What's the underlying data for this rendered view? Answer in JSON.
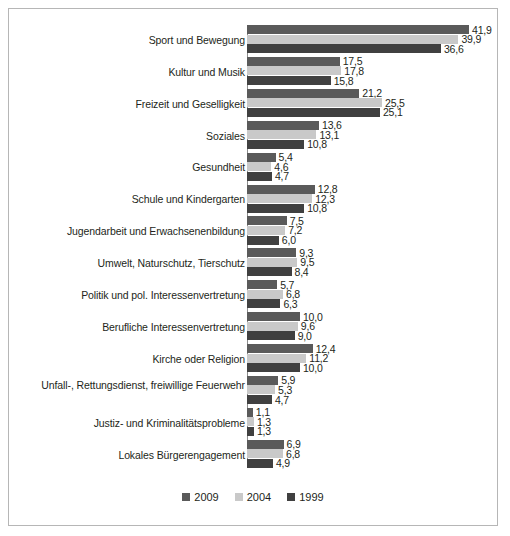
{
  "chart_data": {
    "type": "bar",
    "orientation": "horizontal",
    "title": "",
    "subtitle": "",
    "xlabel": "",
    "ylabel": "",
    "grid": false,
    "xlim": [
      0,
      41.9
    ],
    "value_format": "comma-decimal",
    "legend_position": "bottom-center",
    "categories": [
      "Sport und Bewegung",
      "Kultur und Musik",
      "Freizeit und Geselligkeit",
      "Soziales",
      "Gesundheit",
      "Schule und Kindergarten",
      "Jugendarbeit und Erwachsenenbildung",
      "Umwelt, Naturschutz, Tierschutz",
      "Politik und pol. Interessenvertretung",
      "Berufliche Interessenvertretung",
      "Kirche oder Religion",
      "Unfall-, Rettungsdienst, freiwillige Feuerwehr",
      "Justiz- und Kriminalitätsprobleme",
      "Lokales Bürgerengagement"
    ],
    "series": [
      {
        "name": "2009",
        "color": "#5a5a5a",
        "values": [
          41.9,
          17.5,
          21.2,
          13.6,
          5.4,
          12.8,
          7.5,
          9.3,
          5.7,
          10.0,
          12.4,
          5.9,
          1.1,
          6.9
        ],
        "labels": [
          "41,9",
          "17,5",
          "21,2",
          "13,6",
          "5,4",
          "12,8",
          "7,5",
          "9,3",
          "5,7",
          "10,0",
          "12,4",
          "5,9",
          "1,1",
          "6,9"
        ]
      },
      {
        "name": "2004",
        "color": "#c9c9c9",
        "values": [
          39.9,
          17.8,
          25.5,
          13.1,
          4.6,
          12.3,
          7.2,
          9.5,
          6.8,
          9.6,
          11.2,
          5.3,
          1.3,
          6.8
        ],
        "labels": [
          "39,9",
          "17,8",
          "25,5",
          "13,1",
          "4,6",
          "12,3",
          "7,2",
          "9,5",
          "6,8",
          "9,6",
          "11,2",
          "5,3",
          "1,3",
          "6,8"
        ]
      },
      {
        "name": "1999",
        "color": "#404040",
        "values": [
          36.6,
          15.8,
          25.1,
          10.8,
          4.7,
          10.8,
          6.0,
          8.4,
          6.3,
          9.0,
          10.0,
          4.7,
          1.3,
          4.9
        ],
        "labels": [
          "36,6",
          "15,8",
          "25,1",
          "10,8",
          "4,7",
          "10,8",
          "6,0",
          "8,4",
          "6,3",
          "9,0",
          "10,0",
          "4,7",
          "1,3",
          "4,9"
        ]
      }
    ]
  },
  "legend": {
    "items": [
      {
        "label": "2009",
        "series_class": "s2009"
      },
      {
        "label": "2004",
        "series_class": "s2004"
      },
      {
        "label": "1999",
        "series_class": "s1999"
      }
    ]
  }
}
